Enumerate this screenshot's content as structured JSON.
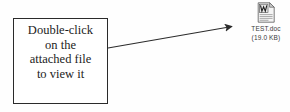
{
  "diagram": {
    "type": "annotated-callout",
    "background_color": "#fefefe",
    "stroke_color": "#2a2a2a"
  },
  "callout": {
    "lines": [
      "Double-click",
      "on the",
      "attached file",
      "to view it"
    ],
    "border_color": "#2a2a2a",
    "fill_color": "#ffffff"
  },
  "arrow": {
    "name": "pointer-arrow",
    "from_x": 108,
    "from_y": 48,
    "to_x": 239,
    "to_y": 25,
    "color": "#2b2b2b"
  },
  "attachment": {
    "icon": "word-document-icon",
    "file_name": "TEST.doc",
    "file_size": "(19.0 KB)",
    "icon_colors": {
      "page": "#f2f2f2",
      "outline": "#555555",
      "glyph": "#2d2d2d",
      "fold": "#c9c9c9"
    }
  }
}
